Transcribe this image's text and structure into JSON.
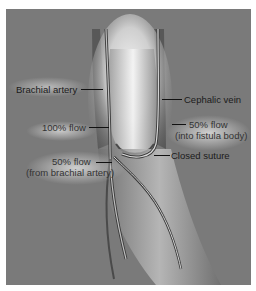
{
  "figure": {
    "background_color": "#7a7a7a",
    "labels": [
      {
        "id": "brachial-artery",
        "text": "Brachial artery"
      },
      {
        "id": "cephalic-vein",
        "text": "Cephalic vein"
      },
      {
        "id": "flow-100",
        "text": "100% flow"
      },
      {
        "id": "flow-50-fistula-line1",
        "text": "50% flow"
      },
      {
        "id": "flow-50-fistula-line2",
        "text": "(into fistula body)"
      },
      {
        "id": "closed-suture",
        "text": "Closed suture"
      },
      {
        "id": "flow-50-brachial-line1",
        "text": "50% flow"
      },
      {
        "id": "flow-50-brachial-line2",
        "text": "(from brachial artery)"
      }
    ]
  }
}
